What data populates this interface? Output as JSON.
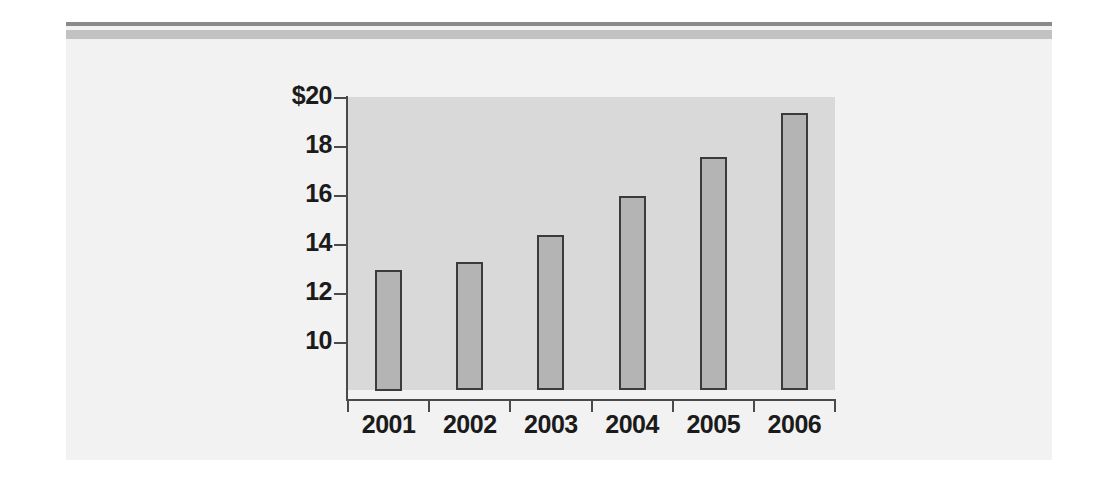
{
  "chart_data": {
    "type": "bar",
    "title": "",
    "xlabel": "",
    "ylabel": "",
    "categories": [
      "2001",
      "2002",
      "2003",
      "2004",
      "2005",
      "2006"
    ],
    "values": [
      13.0,
      13.3,
      14.4,
      16.0,
      17.6,
      19.4
    ],
    "ytick_labels": [
      "$20",
      "18",
      "16",
      "14",
      "12",
      "10"
    ],
    "ytick_values": [
      20,
      18,
      16,
      14,
      12,
      10
    ],
    "ylim": [
      8,
      20
    ],
    "grid": false,
    "legend": null,
    "currency_symbol": "$",
    "colors": {
      "bar_fill": "#b4b4b4",
      "bar_edge": "#3b3b3b",
      "plot_background": "#d9d9d9",
      "page_background": "#f2f2f2",
      "axis": "#4a4a4a",
      "rule_dark": "#8a8a8a",
      "rule_light": "#c2c2c2",
      "text": "#1b1b1b"
    }
  },
  "figure": {
    "rule_top_label": "top-divider-dark",
    "rule_band_label": "top-divider-light"
  }
}
